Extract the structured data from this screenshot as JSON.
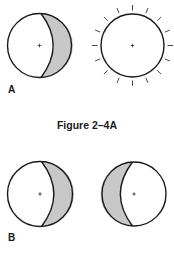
{
  "figure": {
    "caption": "Figure 2–4A",
    "colors": {
      "stroke": "#1a1a1a",
      "shade": "#c8c8c8",
      "fill": "#ffffff"
    },
    "panels": [
      {
        "label": "A",
        "items": [
          {
            "type": "crescent-sphere",
            "shaded_side": "right",
            "center": [
              39.5,
              45.5
            ],
            "r": 32
          },
          {
            "type": "radiating-sphere",
            "rays": 16,
            "center": [
              132.5,
              45.5
            ],
            "r": 31.5
          }
        ]
      },
      {
        "label": "B",
        "items": [
          {
            "type": "crescent-sphere",
            "shaded_side": "right",
            "center": [
              40,
              194
            ],
            "r": 32.5
          },
          {
            "type": "crescent-sphere",
            "shaded_side": "left",
            "center": [
              134,
              194
            ],
            "r": 32
          }
        ]
      }
    ]
  }
}
